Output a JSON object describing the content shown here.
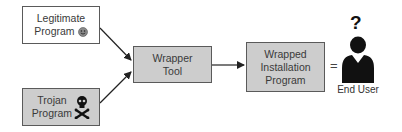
{
  "diagram": {
    "nodes": {
      "legitimate": {
        "line1": "Legitimate",
        "line2": "Program",
        "icon": "smiley-icon"
      },
      "trojan": {
        "line1": "Trojan",
        "line2": "Program",
        "icon": "skull-crossbones-icon"
      },
      "wrapper": {
        "line1": "Wrapper",
        "line2": "Tool"
      },
      "wrapped": {
        "line1": "Wrapped",
        "line2": "Installation",
        "line3": "Program"
      }
    },
    "equals": "=",
    "end_user": {
      "question": "?",
      "label": "End User",
      "icon": "user-icon"
    },
    "edges": [
      {
        "from": "Legitimate Program",
        "to": "Wrapper Tool"
      },
      {
        "from": "Trojan Program",
        "to": "Wrapper Tool"
      },
      {
        "from": "Wrapper Tool",
        "to": "Wrapped Installation Program"
      }
    ],
    "colors": {
      "box_gray": "#cdcdcd",
      "box_white": "#ffffff",
      "border": "#5a5a5a",
      "arrow": "#222222"
    }
  }
}
